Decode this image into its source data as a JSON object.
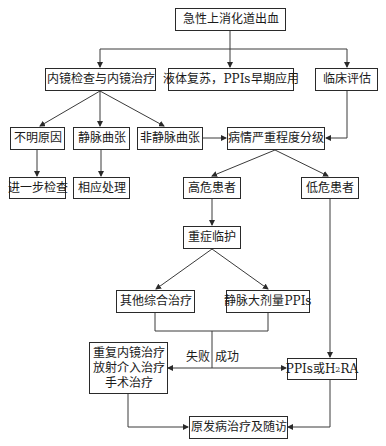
{
  "flowchart": {
    "title_node": "急性上消化道出血",
    "row2": {
      "endoscopy": "内镜检查与内镜治疗",
      "fluid": "液体复苏，PPIs早期应用",
      "clinical": "临床评估"
    },
    "row3": {
      "unknown": "不明原因",
      "varices": "静脉曲张",
      "nonvarices": "非静脉曲张",
      "severity": "病情严重程度分级"
    },
    "row4": {
      "further": "进一步检查",
      "handle": "相应处理",
      "high_risk": "高危患者",
      "low_risk": "低危患者"
    },
    "icu": "重症临护",
    "row6": {
      "other": "其他综合治疗",
      "iv_ppi": "静脉大剂量PPIs"
    },
    "repeat": {
      "line1": "重复内镜治疗",
      "line2": "放射介入治疗",
      "line3": "手术治疗"
    },
    "fail_label": "失败",
    "success_label": "成功",
    "ppi_h2ra": {
      "prefix": "PPIs或H",
      "sub": "2",
      "suffix": "RA"
    },
    "final": "原发病治疗及随访"
  }
}
